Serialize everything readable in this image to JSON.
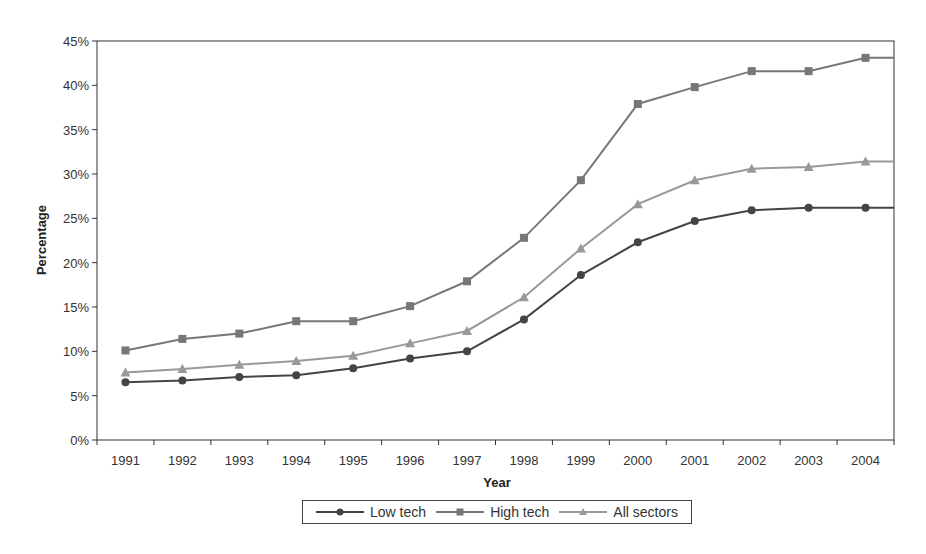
{
  "chart_data": {
    "type": "line",
    "title": "",
    "xlabel": "Year",
    "ylabel": "Percentage",
    "ylim": [
      0,
      45
    ],
    "yticks": [
      "0%",
      "5%",
      "10%",
      "15%",
      "20%",
      "25%",
      "30%",
      "35%",
      "40%",
      "45%"
    ],
    "categories": [
      "1991",
      "1992",
      "1993",
      "1994",
      "1995",
      "1996",
      "1997",
      "1998",
      "1999",
      "2000",
      "2001",
      "2002",
      "2003",
      "2004"
    ],
    "series": [
      {
        "name": "Low tech",
        "marker": "circle",
        "color": "#444444",
        "values": [
          6.5,
          6.7,
          7.1,
          7.3,
          8.1,
          9.2,
          10.0,
          13.6,
          18.6,
          22.3,
          24.7,
          25.9,
          26.2,
          26.2
        ]
      },
      {
        "name": "High tech",
        "marker": "square",
        "color": "#777777",
        "values": [
          10.1,
          11.4,
          12.0,
          13.4,
          13.4,
          15.1,
          17.9,
          22.8,
          29.3,
          37.9,
          39.8,
          41.6,
          41.6,
          43.1
        ]
      },
      {
        "name": "All sectors",
        "marker": "triangle",
        "color": "#999999",
        "values": [
          7.6,
          8.0,
          8.5,
          8.9,
          9.5,
          10.9,
          12.3,
          16.1,
          21.6,
          26.6,
          29.3,
          30.6,
          30.8,
          31.4
        ]
      }
    ],
    "grid": false,
    "legend_position": "bottom"
  }
}
